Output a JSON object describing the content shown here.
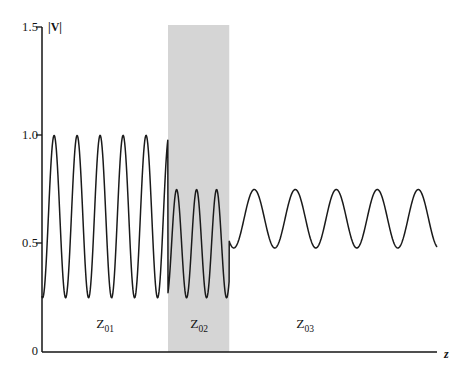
{
  "figure": {
    "axis_y_name": "|V|",
    "axis_x_name": "z"
  },
  "y_ticks": [
    {
      "label": "1.5",
      "value": 1.5
    },
    {
      "label": "1.0",
      "value": 1.0
    },
    {
      "label": "0.5",
      "value": 0.5
    },
    {
      "label": "0",
      "value": 0.0
    }
  ],
  "regions": [
    {
      "key": "z01",
      "label": "Z",
      "sub": "01",
      "shaded": false
    },
    {
      "key": "z02",
      "label": "Z",
      "sub": "02",
      "shaded": true
    },
    {
      "key": "z03",
      "label": "Z",
      "sub": "03",
      "shaded": false
    }
  ],
  "colors": {
    "curve": "#1a1a1a",
    "axis": "#141414",
    "shaded_band": "#d5d5d5",
    "background": "#ffffff"
  },
  "chart_data": {
    "type": "line",
    "title": "",
    "xlabel": "z",
    "ylabel": "|V|",
    "ylim": [
      0,
      1.5
    ],
    "xlim": [
      0,
      1
    ],
    "grid": false,
    "legend": null,
    "yticks": [
      0,
      0.5,
      1.0,
      1.5
    ],
    "ytick_labels": [
      "0",
      "0.5",
      "1.0",
      "1.5"
    ],
    "xticks": [],
    "xtick_labels": [],
    "annotations": [
      {
        "text": "Z01",
        "x_frac": 0.16,
        "y_value": 0.16
      },
      {
        "text": "Z02",
        "x_frac": 0.5,
        "y_value": 0.16
      },
      {
        "text": "Z03",
        "x_frac": 0.78,
        "y_value": 0.16
      }
    ],
    "shaded_regions": [
      {
        "label": "Z02",
        "x_frac_start": 0.319,
        "x_frac_end": 0.474,
        "color": "#d5d5d5"
      }
    ],
    "sections": [
      {
        "name": "Z01",
        "x_frac_start": 0.0,
        "x_frac_end": 0.319,
        "max": 1.0,
        "min": 0.25,
        "period_frac": 0.0582,
        "cycles": 5.5,
        "phase_deg": 170
      },
      {
        "name": "Z02",
        "x_frac_start": 0.319,
        "x_frac_end": 0.474,
        "max": 0.75,
        "min": 0.25,
        "period_frac": 0.0506,
        "cycles": 3.05,
        "phase_deg": 205
      },
      {
        "name": "Z03",
        "x_frac_start": 0.474,
        "x_frac_end": 1.0,
        "max": 0.75,
        "min": 0.48,
        "period_frac": 0.1038,
        "cycles": 5.07,
        "phase_deg": 140
      }
    ]
  }
}
